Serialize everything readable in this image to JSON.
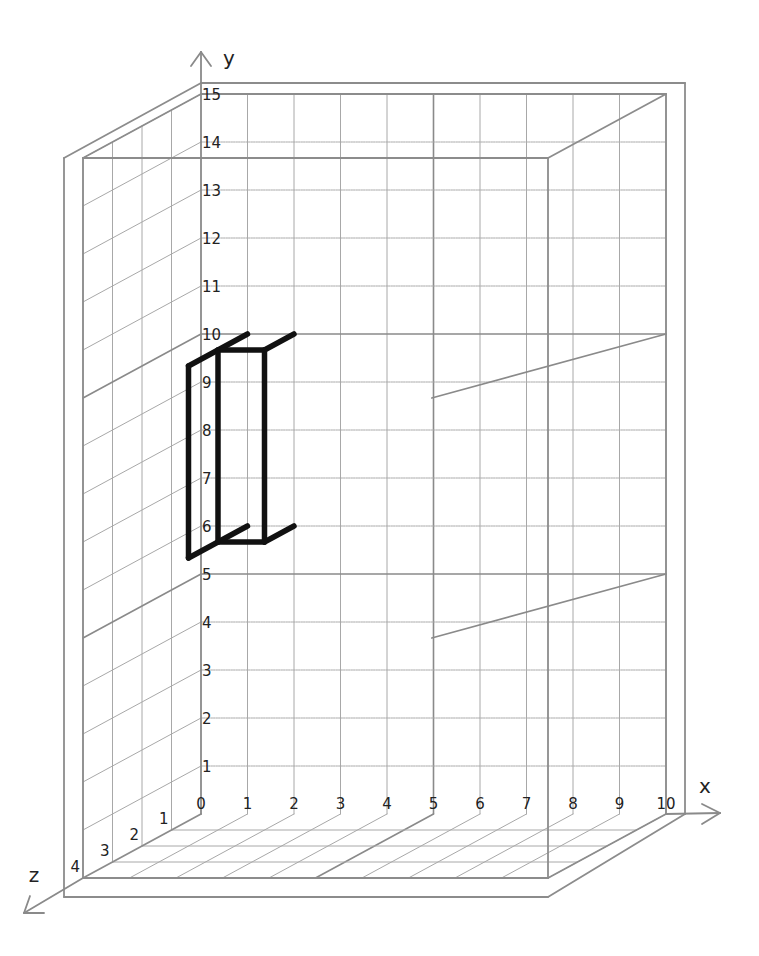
{
  "diagram": {
    "type": "3d-isometric-grid-box",
    "axes": {
      "x": {
        "label": "x",
        "min": 0,
        "max": 10,
        "ticks": [
          "0",
          "1",
          "2",
          "3",
          "4",
          "5",
          "6",
          "7",
          "8",
          "9",
          "10"
        ]
      },
      "y": {
        "label": "y",
        "min": 0,
        "max": 15,
        "ticks": [
          "1",
          "2",
          "3",
          "4",
          "5",
          "6",
          "7",
          "8",
          "9",
          "10",
          "11",
          "12",
          "13",
          "14",
          "15"
        ]
      },
      "z": {
        "label": "z",
        "min": 0,
        "max": 4,
        "ticks": [
          "1",
          "2",
          "3",
          "4"
        ]
      }
    },
    "projection": {
      "origin_px": [
        201,
        814
      ],
      "x_unit_px": [
        46.5,
        0
      ],
      "y_unit_px": [
        0,
        -48
      ],
      "z_unit_px": [
        -29.5,
        16
      ]
    },
    "major_lines": {
      "x": [
        5
      ],
      "y": [
        5,
        10
      ]
    },
    "shape": {
      "description": "Black U-shaped bracket outline",
      "color": "#111111",
      "segments": [
        [
          [
            1,
            10,
            0
          ],
          [
            1,
            10,
            2
          ]
        ],
        [
          [
            2,
            10,
            0
          ],
          [
            2,
            10,
            1
          ]
        ],
        [
          [
            1,
            10,
            1
          ],
          [
            2,
            10,
            1
          ]
        ],
        [
          [
            1,
            6,
            0
          ],
          [
            1,
            6,
            2
          ]
        ],
        [
          [
            2,
            6,
            0
          ],
          [
            2,
            6,
            1
          ]
        ],
        [
          [
            1,
            6,
            1
          ],
          [
            2,
            6,
            1
          ]
        ],
        [
          [
            1,
            6,
            2
          ],
          [
            1,
            10,
            2
          ]
        ],
        [
          [
            1,
            6,
            1
          ],
          [
            1,
            10,
            1
          ]
        ],
        [
          [
            2,
            6,
            1
          ],
          [
            2,
            10,
            1
          ]
        ]
      ]
    },
    "colors": {
      "grid": "#a8a8a8",
      "major": "#8a8a8a",
      "frame": "#8c8c8c",
      "axis": "#8a8a8a",
      "text": "#222222"
    }
  }
}
